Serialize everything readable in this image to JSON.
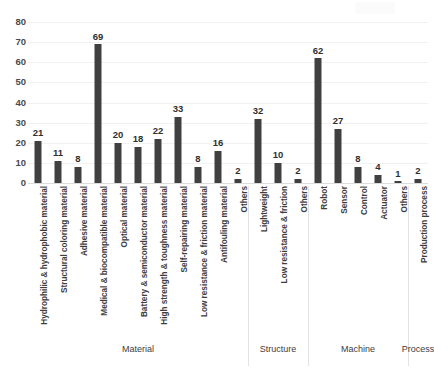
{
  "chart_data": {
    "type": "bar",
    "title": "",
    "subtitle": "",
    "xlabel": "",
    "ylabel": "",
    "ylim": [
      0,
      80
    ],
    "yticks": [
      0,
      10,
      20,
      30,
      40,
      50,
      60,
      70,
      80
    ],
    "grid": true,
    "legend": false,
    "bar_color": "#404040",
    "gridline_color": "#f1f1f1",
    "categories": [
      "Hydrophilic & hydrophobic material",
      "Structural coloring material",
      "Adhesive material",
      "Medical & biocompatible material",
      "Optical material",
      "Battery & semiconductor material",
      "High strength & toughness material",
      "Self-repairing material",
      "Low resistance & friction material",
      "Antifouling material",
      "Others",
      "Lightweight",
      "Low resistance & friction",
      "Others",
      "Robot",
      "Sensor",
      "Control",
      "Actuator",
      "Others",
      "Production process"
    ],
    "values": [
      21,
      11,
      8,
      69,
      20,
      18,
      22,
      33,
      8,
      16,
      2,
      32,
      10,
      2,
      62,
      27,
      8,
      4,
      1,
      2
    ],
    "groups": [
      {
        "label": "Material",
        "start": 0,
        "end": 10
      },
      {
        "label": "Structure",
        "start": 11,
        "end": 13
      },
      {
        "label": "Machine",
        "start": 14,
        "end": 18
      },
      {
        "label": "Process",
        "start": 19,
        "end": 19
      }
    ]
  }
}
